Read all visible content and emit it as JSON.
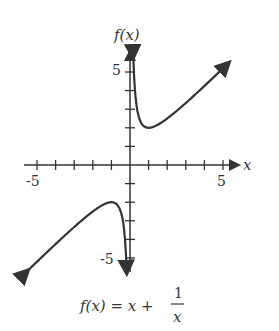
{
  "chart_data": {
    "type": "line",
    "title": "",
    "formula_label": {
      "lhs": "f(x) = x +",
      "numerator": "1",
      "denominator": "x"
    },
    "xlabel": "x",
    "ylabel": "f(x)",
    "xlim": [
      -5.5,
      5.5
    ],
    "ylim": [
      -5.5,
      5.5
    ],
    "x_tick_labels": [
      "-5",
      "5"
    ],
    "y_tick_labels": [
      "5",
      "-5"
    ],
    "tick_step": 1,
    "grid": false,
    "asymptote": "x = 0",
    "series": [
      {
        "name": "f(x) = x + 1/x (x>0)",
        "x": [
          0.18,
          0.25,
          0.5,
          1,
          2,
          3,
          4,
          5.2
        ],
        "y": [
          5.7,
          4.25,
          2.5,
          2,
          2.5,
          3.33,
          4.25,
          5.39
        ]
      },
      {
        "name": "f(x) = x + 1/x (x<0)",
        "x": [
          -5.2,
          -4,
          -3,
          -2,
          -1,
          -0.5,
          -0.25,
          -0.18
        ],
        "y": [
          -5.39,
          -4.25,
          -3.33,
          -2.5,
          -2,
          -2.5,
          -4.25,
          -5.7
        ]
      }
    ]
  }
}
